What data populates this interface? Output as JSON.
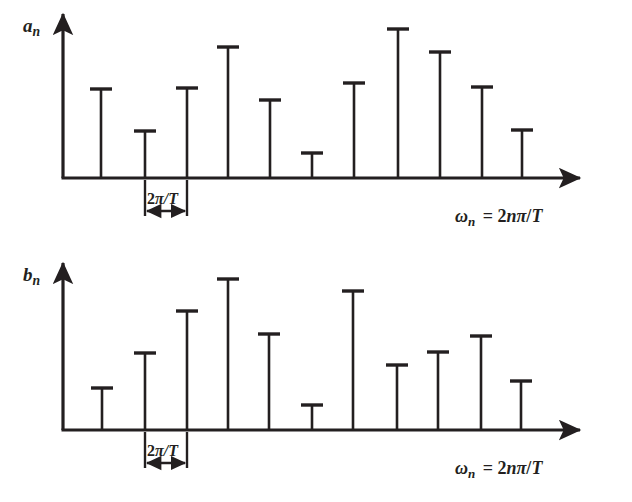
{
  "figure": {
    "background_color": "#ffffff",
    "stroke_color": "#231f20",
    "width": 632,
    "height": 502
  },
  "panels": [
    {
      "id": "panel-an",
      "y_axis_label": "a",
      "y_axis_label_sub": "n",
      "x_axis_label_omega": "ω",
      "x_axis_label_omega_sub": "n",
      "x_axis_label_rest": "= 2nπ/T",
      "spacing_label": "2π/T",
      "geometry": {
        "baseline_y": 178,
        "axis_x": 63,
        "axis_top_y": 14,
        "axis_right_x": 580,
        "spacing_left_x": 145,
        "spacing_right_x": 187,
        "spacing_bracket_top_y": 180,
        "spacing_bracket_bottom_y": 216,
        "spacing_arrow_y": 211,
        "spacing_text_x": 147,
        "spacing_text_y": 204,
        "omega_x": 455,
        "omega_y": 222
      }
    },
    {
      "id": "panel-bn",
      "y_axis_label": "b",
      "y_axis_label_sub": "n",
      "x_axis_label_omega": "ω",
      "x_axis_label_omega_sub": "n",
      "x_axis_label_rest": "= 2nπ/T",
      "spacing_label": "2π/T",
      "geometry": {
        "baseline_y": 430,
        "axis_x": 63,
        "axis_top_y": 263,
        "axis_right_x": 580,
        "spacing_left_x": 145,
        "spacing_right_x": 187,
        "spacing_bracket_top_y": 432,
        "spacing_bracket_bottom_y": 468,
        "spacing_arrow_y": 463,
        "spacing_text_x": 147,
        "spacing_text_y": 456,
        "omega_x": 455,
        "omega_y": 474
      }
    }
  ],
  "chart_data": {
    "type": "bar",
    "subplots": [
      {
        "name": "a_n",
        "ylabel": "a_n",
        "xlabel": "ω_n = 2nπ/T",
        "x_tick_spacing_label": "2π/T",
        "grid": false,
        "legend": "none",
        "x_positions_px": [
          101,
          145,
          187,
          228,
          270,
          312,
          354,
          398,
          440,
          482,
          522
        ],
        "stem_top_px": [
          89,
          131,
          88,
          47,
          100,
          153,
          83,
          29,
          52,
          87,
          130
        ],
        "baseline_px": 178,
        "n": [
          1,
          2,
          3,
          4,
          5,
          6,
          7,
          8,
          9,
          10,
          11
        ],
        "values_normalized": [
          0.6,
          0.32,
          0.6,
          0.88,
          0.52,
          0.17,
          0.64,
          1.0,
          0.85,
          0.61,
          0.32
        ]
      },
      {
        "name": "b_n",
        "ylabel": "b_n",
        "xlabel": "ω_n = 2nπ/T",
        "x_tick_spacing_label": "2π/T",
        "grid": false,
        "legend": "none",
        "x_positions_px": [
          102,
          145,
          187,
          228,
          269,
          312,
          353,
          397,
          438,
          481,
          521
        ],
        "stem_top_px": [
          388,
          353,
          311,
          279,
          334,
          405,
          291,
          365,
          352,
          336,
          381
        ],
        "baseline_px": 430,
        "n": [
          1,
          2,
          3,
          4,
          5,
          6,
          7,
          8,
          9,
          10,
          11
        ],
        "values_normalized": [
          0.28,
          0.51,
          0.79,
          1.0,
          0.64,
          0.17,
          0.92,
          0.43,
          0.52,
          0.62,
          0.32
        ]
      }
    ]
  }
}
